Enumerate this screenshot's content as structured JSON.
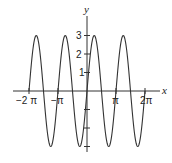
{
  "chart_data": {
    "type": "line",
    "title": "",
    "function": "y = 3 sin(2x)",
    "xlabel": "x",
    "ylabel": "y",
    "xlim": [
      -6.2832,
      6.2832
    ],
    "ylim": [
      -3,
      3
    ],
    "x_ticks": [
      {
        "value": -6.2832,
        "label": "−2 π"
      },
      {
        "value": -3.1416,
        "label": "−π"
      },
      {
        "value": 3.1416,
        "label": "π"
      },
      {
        "value": 6.2832,
        "label": "2π"
      }
    ],
    "y_ticks": [
      {
        "value": 3,
        "label": "3"
      },
      {
        "value": 2,
        "label": "2"
      },
      {
        "value": 1,
        "label": "1"
      },
      {
        "value": -1,
        "label": ""
      },
      {
        "value": -2,
        "label": ""
      },
      {
        "value": -3,
        "label": ""
      }
    ],
    "series": [
      {
        "name": "3 sin(2x)",
        "amplitude": 3,
        "period": 3.1416,
        "color": "#333333"
      }
    ],
    "grid": false,
    "legend": null
  },
  "axes": {
    "x_label": "x",
    "y_label": "y",
    "tick_labels": {
      "neg_two_pi": "−2 π",
      "neg_pi": "−π",
      "pi": "π",
      "two_pi": "2π",
      "y3": "3",
      "y2": "2",
      "y1": "1"
    }
  }
}
